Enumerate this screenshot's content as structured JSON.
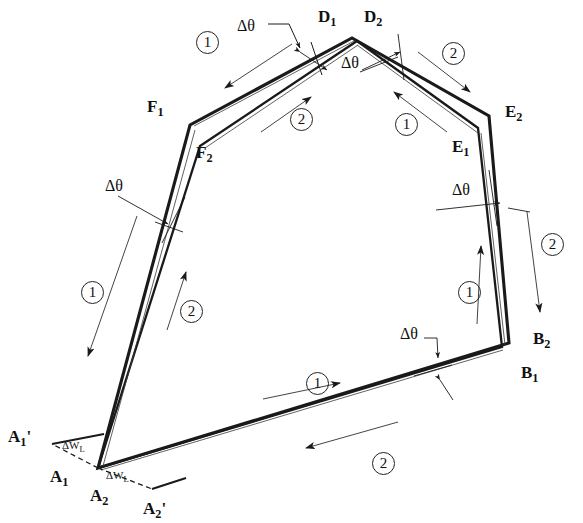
{
  "figure": {
    "type": "engineering-line-diagram",
    "title": "",
    "background": "#ffffff",
    "line_color": "#1a1a1a"
  },
  "symbols": {
    "delta_theta": "Δθ",
    "delta_w": "ΔW",
    "delta_w_sub": "L",
    "pass_one": "1",
    "pass_two": "2",
    "prime": "'"
  },
  "vertex_labels": [
    {
      "id": "D1",
      "base": "D",
      "sub": "1",
      "prime": "",
      "x": 318,
      "y": 8
    },
    {
      "id": "D2",
      "base": "D",
      "sub": "2",
      "prime": "",
      "x": 364,
      "y": 8
    },
    {
      "id": "E2",
      "base": "E",
      "sub": "2",
      "prime": "",
      "x": 505,
      "y": 103
    },
    {
      "id": "E1",
      "base": "E",
      "sub": "1",
      "prime": "",
      "x": 452,
      "y": 138
    },
    {
      "id": "F1",
      "base": "F",
      "sub": "1",
      "prime": "",
      "x": 147,
      "y": 98
    },
    {
      "id": "F2",
      "base": "F",
      "sub": "2",
      "prime": "",
      "x": 196,
      "y": 144
    },
    {
      "id": "B2",
      "base": "B",
      "sub": "2",
      "prime": "",
      "x": 533,
      "y": 330
    },
    {
      "id": "B1",
      "base": "B",
      "sub": "1",
      "prime": "",
      "x": 521,
      "y": 364
    },
    {
      "id": "A1p",
      "base": "A",
      "sub": "1",
      "prime": "'",
      "x": 8,
      "y": 428
    },
    {
      "id": "A1",
      "base": "A",
      "sub": "1",
      "prime": "",
      "x": 50,
      "y": 468
    },
    {
      "id": "A2",
      "base": "A",
      "sub": "2",
      "prime": "",
      "x": 90,
      "y": 487
    },
    {
      "id": "A2p",
      "base": "A",
      "sub": "2",
      "prime": "'",
      "x": 143,
      "y": 500
    }
  ],
  "angle_annotations": [
    {
      "id": "dtheta-top-left",
      "label": "Δθ",
      "x": 237,
      "y": 18
    },
    {
      "id": "dtheta-top-right",
      "label": "Δθ",
      "x": 341,
      "y": 55
    },
    {
      "id": "dtheta-left",
      "label": "Δθ",
      "x": 105,
      "y": 178
    },
    {
      "id": "dtheta-right",
      "label": "Δθ",
      "x": 452,
      "y": 182
    },
    {
      "id": "dtheta-bottom",
      "label": "Δθ",
      "x": 400,
      "y": 326
    }
  ],
  "width_annotations": [
    {
      "id": "dwl-upper",
      "base": "ΔW",
      "sub": "L",
      "x": 62,
      "y": 440
    },
    {
      "id": "dwl-lower",
      "base": "ΔW",
      "sub": "L",
      "x": 106,
      "y": 470
    }
  ],
  "pass_markers": [
    {
      "id": "pass-marker-top-left",
      "label": "1",
      "x": 196,
      "y": 31
    },
    {
      "id": "pass-marker-top-right",
      "label": "2",
      "x": 442,
      "y": 42
    },
    {
      "id": "pass-marker-upper-mid",
      "label": "2",
      "x": 290,
      "y": 108
    },
    {
      "id": "pass-marker-upper-right",
      "label": "1",
      "x": 395,
      "y": 113
    },
    {
      "id": "pass-marker-left-outer",
      "label": "1",
      "x": 81,
      "y": 281
    },
    {
      "id": "pass-marker-left-inner",
      "label": "2",
      "x": 180,
      "y": 300
    },
    {
      "id": "pass-marker-right-inner",
      "label": "1",
      "x": 458,
      "y": 281
    },
    {
      "id": "pass-marker-right-outer",
      "label": "2",
      "x": 541,
      "y": 233
    },
    {
      "id": "pass-marker-bottom-upper",
      "label": "1",
      "x": 306,
      "y": 372
    },
    {
      "id": "pass-marker-bottom-lower",
      "label": "2",
      "x": 372,
      "y": 452
    }
  ],
  "geometry": {
    "contour_1": [
      [
        98,
        468
      ],
      [
        190,
        125
      ],
      [
        352,
        38
      ],
      [
        489,
        116
      ],
      [
        509,
        343
      ],
      [
        98,
        468
      ]
    ],
    "contour_2": [
      [
        98,
        468
      ],
      [
        200,
        146
      ],
      [
        357,
        40
      ],
      [
        478,
        128
      ],
      [
        502,
        347
      ],
      [
        98,
        468
      ]
    ],
    "vertices": {
      "A": [
        98,
        468
      ],
      "A1_prime": [
        52,
        444
      ],
      "A2_prime": [
        152,
        489
      ],
      "F1": [
        190,
        125
      ],
      "F2": [
        200,
        146
      ],
      "D": [
        354,
        39
      ],
      "E2": [
        489,
        116
      ],
      "E1": [
        478,
        128
      ],
      "B2": [
        513,
        334
      ],
      "B1": [
        505,
        349
      ]
    }
  }
}
